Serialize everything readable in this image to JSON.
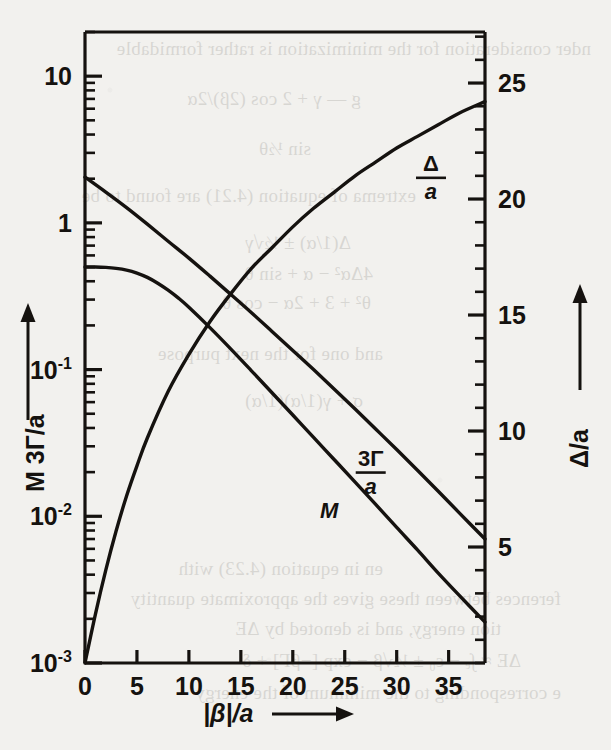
{
  "figure": {
    "name": "log-linear-plot-3Gamma-M-Delta-vs-beta",
    "background_color": "#f2f1ee",
    "ink_color": "#15120f"
  },
  "chart_data": {
    "type": "line",
    "title": "",
    "xlabel": "|β|/a",
    "xlabel_arrow": "⟶",
    "ylabel_left": "M  3Γ/a",
    "ylabel_left_arrow": "↑",
    "ylabel_right": "Δ/a",
    "ylabel_right_arrow": "↑",
    "x_scale": "linear",
    "y_left_scale": "log",
    "y_right_scale": "linear",
    "xlim": [
      0,
      38.5
    ],
    "ylim_left": [
      0.001,
      20
    ],
    "ylim_right": [
      0,
      27.2
    ],
    "xticks": [
      0,
      5,
      10,
      15,
      20,
      25,
      30,
      35
    ],
    "xticklabels": [
      "0",
      "5",
      "10",
      "15",
      "20",
      "25",
      "30",
      "35"
    ],
    "yticks_left": [
      10,
      1,
      0.1,
      0.01,
      0.001
    ],
    "yticklabels_left": [
      {
        "mantissa": "10",
        "exponent": ""
      },
      {
        "mantissa": "1",
        "exponent": ""
      },
      {
        "mantissa": "10",
        "exponent": "-1"
      },
      {
        "mantissa": "10",
        "exponent": "-2"
      },
      {
        "mantissa": "10",
        "exponent": "-3"
      }
    ],
    "yticks_right": [
      5,
      10,
      15,
      20,
      25
    ],
    "yticklabels_right": [
      "5",
      "10",
      "15",
      "20",
      "25"
    ],
    "y_right_minor_step": 1,
    "grid": false,
    "legend_position": "inline-curve-labels",
    "series": [
      {
        "name": "3Γ/a",
        "label": "3Γ/a",
        "axis": "left",
        "label_x": 27.5,
        "label_y_left": 0.0205,
        "points": [
          {
            "x": 0,
            "y": 2.05
          },
          {
            "x": 2,
            "y": 1.62
          },
          {
            "x": 4,
            "y": 1.27
          },
          {
            "x": 6,
            "y": 0.98
          },
          {
            "x": 8,
            "y": 0.75
          },
          {
            "x": 10,
            "y": 0.575
          },
          {
            "x": 12,
            "y": 0.435
          },
          {
            "x": 14,
            "y": 0.327
          },
          {
            "x": 16,
            "y": 0.245
          },
          {
            "x": 18,
            "y": 0.182
          },
          {
            "x": 20,
            "y": 0.135
          },
          {
            "x": 22,
            "y": 0.1
          },
          {
            "x": 24,
            "y": 0.0735
          },
          {
            "x": 26,
            "y": 0.0538
          },
          {
            "x": 28,
            "y": 0.0392
          },
          {
            "x": 30,
            "y": 0.0285
          },
          {
            "x": 32,
            "y": 0.0206
          },
          {
            "x": 34,
            "y": 0.0148
          },
          {
            "x": 36,
            "y": 0.0106
          },
          {
            "x": 38.5,
            "y": 0.007
          }
        ]
      },
      {
        "name": "M",
        "label": "M",
        "axis": "left",
        "label_x": 23.5,
        "label_y_left": 0.0098,
        "points": [
          {
            "x": 0,
            "y": 0.5
          },
          {
            "x": 1,
            "y": 0.5
          },
          {
            "x": 2,
            "y": 0.497
          },
          {
            "x": 3,
            "y": 0.49
          },
          {
            "x": 4,
            "y": 0.477
          },
          {
            "x": 5,
            "y": 0.455
          },
          {
            "x": 6,
            "y": 0.425
          },
          {
            "x": 7,
            "y": 0.388
          },
          {
            "x": 8,
            "y": 0.348
          },
          {
            "x": 9,
            "y": 0.307
          },
          {
            "x": 10,
            "y": 0.266
          },
          {
            "x": 12,
            "y": 0.194
          },
          {
            "x": 14,
            "y": 0.139
          },
          {
            "x": 16,
            "y": 0.0985
          },
          {
            "x": 18,
            "y": 0.0695
          },
          {
            "x": 20,
            "y": 0.049
          },
          {
            "x": 22,
            "y": 0.0345
          },
          {
            "x": 24,
            "y": 0.0243
          },
          {
            "x": 26,
            "y": 0.0171
          },
          {
            "x": 28,
            "y": 0.012
          },
          {
            "x": 30,
            "y": 0.0084
          },
          {
            "x": 32,
            "y": 0.0059
          },
          {
            "x": 34,
            "y": 0.0041
          },
          {
            "x": 36,
            "y": 0.0029
          },
          {
            "x": 38.5,
            "y": 0.0019
          }
        ]
      },
      {
        "name": "Δ/a",
        "label": "Δ/a",
        "axis": "right",
        "label_x": 33.3,
        "label_y_right": 21.0,
        "points": [
          {
            "x": 0,
            "y": 0.0
          },
          {
            "x": 1,
            "y": 2.1
          },
          {
            "x": 2,
            "y": 4.0
          },
          {
            "x": 3,
            "y": 5.7
          },
          {
            "x": 4,
            "y": 7.2
          },
          {
            "x": 5,
            "y": 8.5
          },
          {
            "x": 6,
            "y": 9.7
          },
          {
            "x": 8,
            "y": 11.7
          },
          {
            "x": 10,
            "y": 13.3
          },
          {
            "x": 12,
            "y": 14.7
          },
          {
            "x": 14,
            "y": 15.9
          },
          {
            "x": 16,
            "y": 17.0
          },
          {
            "x": 18,
            "y": 17.9
          },
          {
            "x": 20,
            "y": 18.8
          },
          {
            "x": 22,
            "y": 19.6
          },
          {
            "x": 24,
            "y": 20.3
          },
          {
            "x": 26,
            "y": 21.0
          },
          {
            "x": 28,
            "y": 21.6
          },
          {
            "x": 30,
            "y": 22.2
          },
          {
            "x": 32,
            "y": 22.7
          },
          {
            "x": 34,
            "y": 23.2
          },
          {
            "x": 36,
            "y": 23.7
          },
          {
            "x": 38.5,
            "y": 24.2
          }
        ]
      }
    ]
  },
  "page_bleed": {
    "lines": [
      {
        "text": "nder consideration for the minimization is rather formidable",
        "x": 20,
        "y": 38
      },
      {
        "text": "g — γ + 2 cos (2β)/2α",
        "x": 250,
        "y": 88
      },
      {
        "text": "sin ½θ",
        "x": 300,
        "y": 138
      },
      {
        "text": "extrema of equation (4.21) are found to be",
        "x": 195,
        "y": 185
      },
      {
        "text": "Δ(1/α) ± ½√γ",
        "x": 260,
        "y": 232
      },
      {
        "text": "4Δα² − α + sin θ",
        "x": 238,
        "y": 263
      },
      {
        "text": "θ² + 3 + 2α − cos θ",
        "x": 240,
        "y": 292
      },
      {
        "text": "and one for the next purpose",
        "x": 228,
        "y": 343
      },
      {
        "text": "σ + γ(1/α)(1/α)",
        "x": 248,
        "y": 390
      },
      {
        "text": "en in equation (4.23) with",
        "x": 228,
        "y": 558
      },
      {
        "text": "ferences between these gives the approximate quantity",
        "x": 50,
        "y": 588
      },
      {
        "text": "tion energy, and is denoted by ΔE",
        "x": 110,
        "y": 618
      },
      {
        "text": "ΔE ≈ ∫ₑ − ε₀ ± ½√β − exp [−βΓ] + δ",
        "x": 90,
        "y": 650
      },
      {
        "text": "e corresponding to the minimum of the energy",
        "x": 50,
        "y": 682
      }
    ]
  }
}
